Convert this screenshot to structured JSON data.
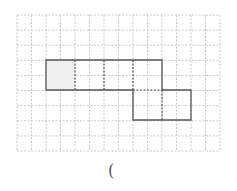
{
  "diagram": {
    "grid": {
      "x0": 17,
      "y0": 15,
      "x1": 220,
      "y1": 151,
      "cols": 14,
      "rows": 9,
      "color": "#c8c8c8"
    },
    "shape": {
      "stroke": "#555555",
      "shaded_fill": "#efefef",
      "squares": [
        {
          "col": 0,
          "row": 0,
          "shaded": true
        },
        {
          "col": 1,
          "row": 0,
          "shaded": false
        },
        {
          "col": 2,
          "row": 0,
          "shaded": false
        },
        {
          "col": 3,
          "row": 0,
          "shaded": false
        },
        {
          "col": 3,
          "row": 1,
          "shaded": false
        },
        {
          "col": 4,
          "row": 1,
          "shaded": false
        }
      ]
    },
    "answer_blank": "("
  }
}
